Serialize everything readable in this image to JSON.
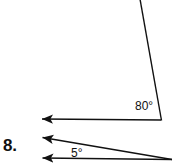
{
  "page": {
    "background_color": "#ffffff",
    "ink_color": "#111111",
    "width": 173,
    "height": 166
  },
  "problem": {
    "number_label": "8."
  },
  "figures": [
    {
      "name": "obtuse-angle-figure",
      "angle_label": "80°",
      "angle_degrees": 80,
      "vertex": {
        "x": 161,
        "y": 120
      },
      "rays": [
        {
          "name": "horizontal-ray-left",
          "from": {
            "x": 161,
            "y": 120
          },
          "to": {
            "x": 31,
            "y": 119
          },
          "arrowhead": "at-end"
        },
        {
          "name": "slanted-ray-up",
          "from": {
            "x": 161,
            "y": 120
          },
          "to": {
            "x": 140,
            "y": 0
          },
          "arrowhead": "none"
        }
      ]
    },
    {
      "name": "acute-angle-figure",
      "angle_label": "5°",
      "angle_degrees": 5,
      "vertex": {
        "x": 171,
        "y": 159
      },
      "rays": [
        {
          "name": "upper-ray-left",
          "from": {
            "x": 171,
            "y": 159
          },
          "to": {
            "x": 31,
            "y": 136
          },
          "arrowhead": "at-end"
        },
        {
          "name": "lower-ray-left",
          "from": {
            "x": 171,
            "y": 159
          },
          "to": {
            "x": 31,
            "y": 158
          },
          "arrowhead": "at-end"
        }
      ]
    }
  ],
  "strokes": {
    "line_width": 1.4,
    "arrow_length": 11,
    "arrow_half_width": 4.5
  }
}
